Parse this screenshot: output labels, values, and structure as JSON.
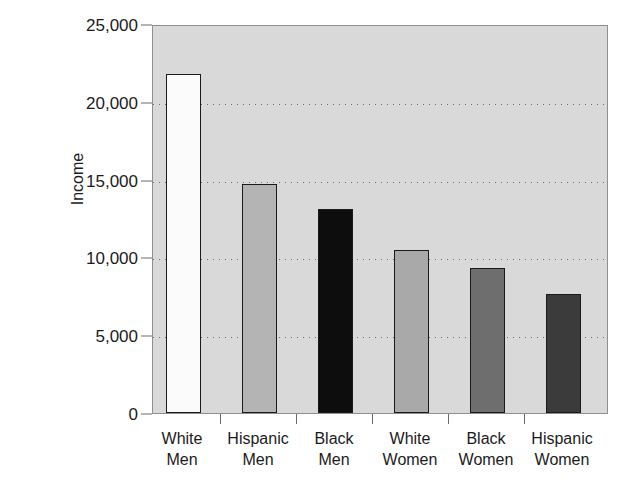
{
  "chart_data": {
    "type": "bar",
    "title": "",
    "xlabel": "",
    "ylabel": "Income",
    "categories": [
      "White Men",
      "Hispanic Men",
      "Black Men",
      "White Women",
      "Black Women",
      "Hispanic Women"
    ],
    "category_lines": [
      [
        "White",
        "Men"
      ],
      [
        "Hispanic",
        "Men"
      ],
      [
        "Black",
        "Men"
      ],
      [
        "White",
        "Women"
      ],
      [
        "Black",
        "Women"
      ],
      [
        "Hispanic",
        "Women"
      ]
    ],
    "values": [
      21800,
      14700,
      13100,
      10500,
      9350,
      7650
    ],
    "bar_colors": [
      "#fbfbfb",
      "#b4b4b4",
      "#0d0d0d",
      "#a9a9a9",
      "#6e6e6e",
      "#3b3b3b"
    ],
    "bar_border_color": "#1a1a1a",
    "ylim": [
      0,
      25000
    ],
    "yticks": [
      0,
      5000,
      10000,
      15000,
      20000,
      25000
    ],
    "ytick_labels": [
      "0",
      "5,000",
      "10,000",
      "15,000",
      "20,000",
      "25,000"
    ],
    "grid": true,
    "grid_style": "dotted-horizontal",
    "legend": "none",
    "plot_background": "#d9d9d9",
    "page_background": "#ffffff",
    "axis_color": "#8f8f8f",
    "text_color": "#1b1b1b"
  }
}
